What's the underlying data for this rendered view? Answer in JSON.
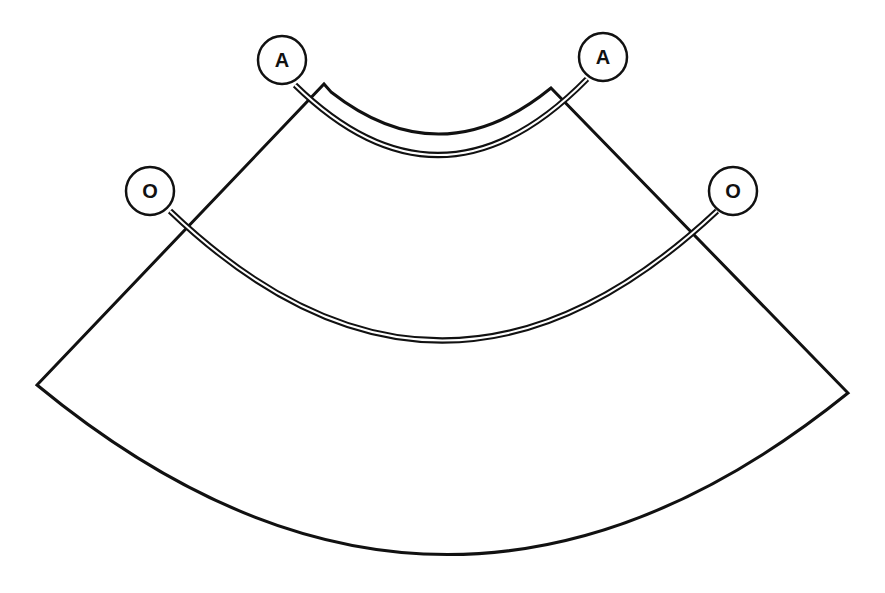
{
  "diagram": {
    "type": "annular-sector-with-arcs",
    "colors": {
      "stroke": "#111111",
      "background": "#ffffff"
    },
    "markers": [
      {
        "id": "a-left",
        "label": "A",
        "cx": 282,
        "cy": 60
      },
      {
        "id": "a-right",
        "label": "A",
        "cx": 603,
        "cy": 57
      },
      {
        "id": "o-left",
        "label": "O",
        "cx": 150,
        "cy": 191
      },
      {
        "id": "o-right",
        "label": "O",
        "cx": 733,
        "cy": 191
      }
    ],
    "arcs": [
      {
        "name": "arc-a",
        "connects": [
          "A",
          "A"
        ]
      },
      {
        "name": "arc-o",
        "connects": [
          "O",
          "O"
        ]
      }
    ]
  }
}
